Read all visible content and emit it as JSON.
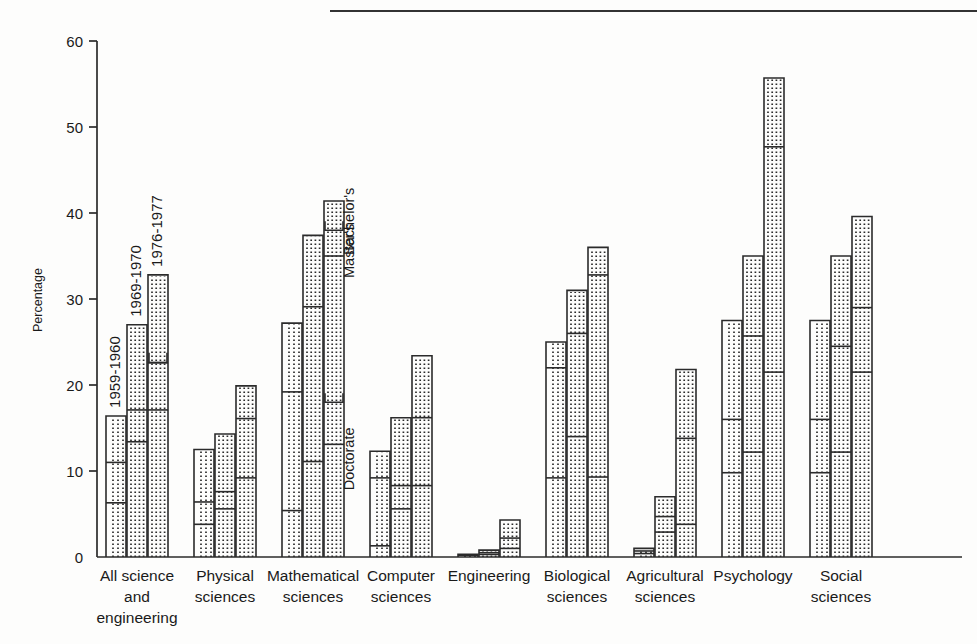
{
  "chart_data": {
    "type": "bar",
    "title": "",
    "subtitle": "",
    "xlabel": "",
    "ylabel": "Percentage",
    "ylim": [
      0,
      60
    ],
    "yticks": [
      0,
      10,
      20,
      30,
      40,
      50,
      60
    ],
    "ytick_labels": [
      "0",
      "10",
      "20",
      "30",
      "40",
      "50",
      "60"
    ],
    "grid": false,
    "legend_position": "in-plot-rotated-labels",
    "note": "Each category has three bars (one per time period). Each bar is subdivided by degree level: Doctorate (lowest line), Master's (middle line), Bachelor's (bar top).",
    "categories": [
      "All science and engineering",
      "Physical sciences",
      "Mathematical sciences",
      "Computer sciences",
      "Engineering",
      "Biological sciences",
      "Agricultural sciences",
      "Psychology",
      "Social sciences"
    ],
    "category_label_lines": [
      [
        "All science",
        "and",
        "engineering"
      ],
      [
        "Physical",
        "sciences"
      ],
      [
        "Mathematical",
        "sciences"
      ],
      [
        "Computer",
        "sciences"
      ],
      [
        "Engineering"
      ],
      [
        "Biological",
        "sciences"
      ],
      [
        "Agricultural",
        "sciences"
      ],
      [
        "Psychology"
      ],
      [
        "Social",
        "sciences"
      ]
    ],
    "series": [
      {
        "name": "1959-1960",
        "bar_index": 0,
        "style": "solid",
        "bachelors": [
          16.4,
          12.5,
          27.2,
          12.3,
          0.3,
          25.0,
          1.0,
          27.5,
          27.5
        ],
        "masters": [
          11.0,
          6.4,
          19.2,
          9.2,
          0.2,
          22.0,
          0.7,
          16.0,
          16.0
        ],
        "doctorate": [
          6.3,
          3.8,
          5.4,
          1.3,
          0.1,
          9.2,
          0.4,
          9.8,
          9.8
        ]
      },
      {
        "name": "1969-1970",
        "bar_index": 1,
        "style": "dotted",
        "bachelors": [
          27.0,
          14.3,
          37.4,
          16.2,
          0.8,
          31.0,
          7.0,
          35.0,
          35.0
        ],
        "masters": [
          17.1,
          7.6,
          29.1,
          8.3,
          0.5,
          26.0,
          4.7,
          25.7,
          24.5
        ],
        "doctorate": [
          13.4,
          5.6,
          11.1,
          5.6,
          0.3,
          14.0,
          2.9,
          12.2,
          12.2
        ]
      },
      {
        "name": "1976-1977",
        "bar_index": 2,
        "style": "dotted",
        "bachelors": [
          32.8,
          19.9,
          41.4,
          23.4,
          4.3,
          36.0,
          21.8,
          55.7,
          39.6
        ],
        "masters": [
          22.6,
          16.1,
          35.0,
          16.2,
          2.2,
          32.8,
          13.8,
          47.7,
          29.0
        ],
        "doctorate": [
          17.1,
          9.2,
          13.1,
          8.3,
          1.0,
          9.3,
          3.8,
          21.5,
          21.5
        ]
      }
    ],
    "level_annotations": [
      "Bachelor's",
      "Master's",
      "Doctorate"
    ],
    "series_annotations": [
      "1959-1960",
      "1969-1970",
      "1976-1977"
    ]
  },
  "axis": {
    "y_title": "Percentage"
  }
}
